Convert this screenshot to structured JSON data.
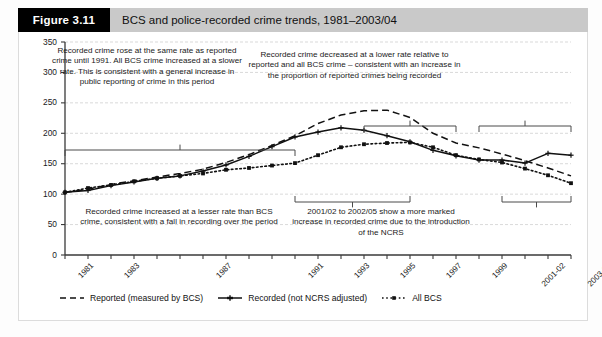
{
  "header": {
    "figure_tag": "Figure 3.11",
    "title": "BCS and police-recorded crime trends, 1981–2003/04"
  },
  "annotations": {
    "top_left": "Recorded crime rose at the same rate as reported crime until 1991. All BCS crime increased at a slower rate. This is consistent with a general increase in public reporting of crime in this period",
    "top_right": "Recorded crime decreased at a lower rate relative to reported and all BCS crime – consistent with an increase in the proportion of reported crimes being recorded",
    "bottom_left": "Recorded crime increased at a lesser rate than BCS crime, consistent with a fall in recording over the period",
    "bottom_right": "2001/02 to 2002/05 show a more marked increase in recorded crime due to the introduction of the NCRS"
  },
  "legend": {
    "items": [
      {
        "label": "Reported (measured by BCS)",
        "style": "dashed",
        "marker": "none",
        "color": "#111111"
      },
      {
        "label": "Recorded (not NCRS adjusted)",
        "style": "solid",
        "marker": "plus",
        "color": "#111111"
      },
      {
        "label": "All BCS",
        "style": "dotted",
        "marker": "square",
        "color": "#111111"
      }
    ]
  },
  "chart_data": {
    "type": "line",
    "title": "BCS and police-recorded crime trends, 1981–2003/04",
    "xlabel": "",
    "ylabel": "",
    "ylim": [
      0,
      350
    ],
    "yticks": [
      0,
      50,
      100,
      150,
      200,
      250,
      300,
      350
    ],
    "grid": true,
    "legend_position": "bottom",
    "x": [
      "1981",
      "1982",
      "1983",
      "1984",
      "1985",
      "1986",
      "1987",
      "1988",
      "1989",
      "1990",
      "1991",
      "1992",
      "1993",
      "1994",
      "1995",
      "1996",
      "1997",
      "1998",
      "1999",
      "2000",
      "2001-02",
      "2002-03",
      "2003-04"
    ],
    "xtick_labels": [
      "1981",
      "1983",
      "1987",
      "1991",
      "1993",
      "1995",
      "1997",
      "1999",
      "2001-02",
      "2003-04"
    ],
    "series": [
      {
        "name": "Reported (measured by BCS)",
        "values": [
          103,
          108,
          116,
          122,
          128,
          134,
          141,
          152,
          165,
          180,
          196,
          216,
          230,
          237,
          238,
          226,
          200,
          184,
          176,
          166,
          155,
          143,
          130
        ]
      },
      {
        "name": "Recorded (not NCRS adjusted)",
        "values": [
          103,
          106,
          114,
          120,
          126,
          130,
          138,
          148,
          162,
          178,
          194,
          202,
          209,
          205,
          196,
          186,
          172,
          163,
          156,
          156,
          151,
          167,
          164
        ]
      },
      {
        "name": "All BCS",
        "values": [
          103,
          110,
          115,
          121,
          126,
          130,
          134,
          140,
          143,
          147,
          151,
          164,
          177,
          182,
          184,
          185,
          177,
          164,
          157,
          152,
          142,
          131,
          118
        ]
      }
    ]
  }
}
